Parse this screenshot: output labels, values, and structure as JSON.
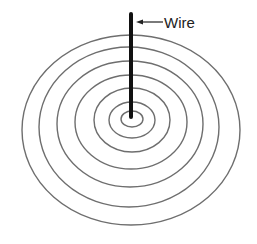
{
  "diagram": {
    "label_wire": "Wire",
    "colors": {
      "rings": "#6e6e6e",
      "wire": "#111111",
      "text": "#222222",
      "background": "#ffffff"
    },
    "wire": {
      "x": 131,
      "y_top": 14,
      "y_bottom": 117
    },
    "label_arrow": {
      "x_from": 163,
      "x_to": 136,
      "y": 22
    },
    "rings": [
      {
        "cx": 132,
        "cy": 119,
        "rx": 11,
        "ry": 8
      },
      {
        "cx": 132,
        "cy": 120,
        "rx": 23,
        "ry": 18
      },
      {
        "cx": 132,
        "cy": 120,
        "rx": 38,
        "ry": 32
      },
      {
        "cx": 131,
        "cy": 122,
        "rx": 56,
        "ry": 47
      },
      {
        "cx": 130,
        "cy": 124,
        "rx": 73,
        "ry": 63
      },
      {
        "cx": 129,
        "cy": 127,
        "rx": 90,
        "ry": 80
      },
      {
        "cx": 131,
        "cy": 130,
        "rx": 109,
        "ry": 95
      }
    ]
  }
}
